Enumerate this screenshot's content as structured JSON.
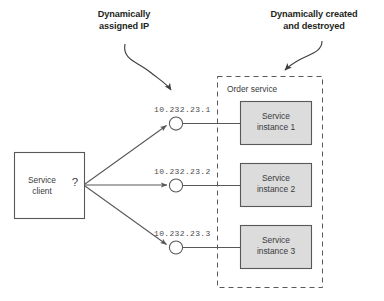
{
  "diagram": {
    "annotations": [
      {
        "id": "dynamic-ip",
        "text": "Dynamically\nassigned IP"
      },
      {
        "id": "dynamic-lifecycle",
        "text": "Dynamically created\nand destroyed"
      }
    ],
    "client": {
      "label": "Service\nclient",
      "question_mark": "?"
    },
    "group": {
      "label": "Order service"
    },
    "endpoints": [
      {
        "ip": "10.232.23.1",
        "instance_label": "Service\ninstance 1"
      },
      {
        "ip": "10.232.23.2",
        "instance_label": "Service\ninstance 2"
      },
      {
        "ip": "10.232.23.3",
        "instance_label": "Service\ninstance 3"
      }
    ],
    "colors": {
      "stroke": "#58585b",
      "instance_fill": "#dcdcdc",
      "client_fill": "#ffffff",
      "text": "#3b3b3d",
      "annotation_text": "#231f20",
      "ip_text": "#4d4d4f",
      "background": "#ffffff"
    }
  }
}
